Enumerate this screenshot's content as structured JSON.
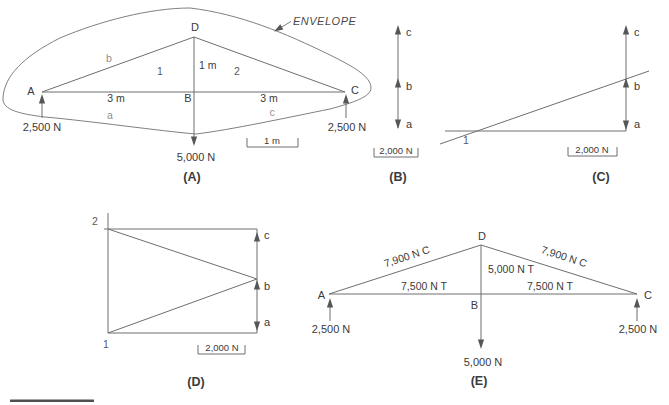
{
  "colors": {
    "line": "#6e6e6e",
    "text": "#3a3a3a",
    "muted_label": "#8f8f8f",
    "background": "#ffffff"
  },
  "panel_a": {
    "caption": "(A)",
    "envelope_label": "ENVELOPE",
    "joints": {
      "a": "A",
      "b": "B",
      "c": "C",
      "d": "D"
    },
    "members": {
      "left_rafter": "b",
      "left_chord": "a",
      "right_chord": "c",
      "left_panel": "1",
      "right_panel": "2"
    },
    "dimensions": {
      "left_span": "3 m",
      "right_span": "3 m",
      "height": "1 m"
    },
    "loads": {
      "left_reaction": "2,500 N",
      "right_reaction": "2,500 N",
      "center_load": "5,000 N"
    },
    "scale": "1 m"
  },
  "panel_b": {
    "caption": "(B)",
    "points": {
      "top": "c",
      "mid": "b",
      "bottom": "a"
    },
    "scale": "2,000 N"
  },
  "panel_c": {
    "caption": "(C)",
    "points": {
      "top": "c",
      "mid": "b",
      "bottom": "a"
    },
    "nodes": {
      "n1": "1"
    },
    "scale": "2,000 N"
  },
  "panel_d": {
    "caption": "(D)",
    "points": {
      "top": "c",
      "mid": "b",
      "bottom": "a"
    },
    "nodes": {
      "n1": "1",
      "n2": "2"
    },
    "scale": "2,000 N"
  },
  "panel_e": {
    "caption": "(E)",
    "joints": {
      "a": "A",
      "b": "B",
      "c": "C",
      "d": "D"
    },
    "forces": {
      "left_rafter": "7,900 N C",
      "right_rafter": "7,900 N C",
      "center_post": "5,000 N T",
      "left_chord": "7,500 N T",
      "right_chord": "7,500 N T"
    },
    "loads": {
      "left_reaction": "2,500 N",
      "right_reaction": "2,500 N",
      "center_load": "5,000 N"
    }
  }
}
